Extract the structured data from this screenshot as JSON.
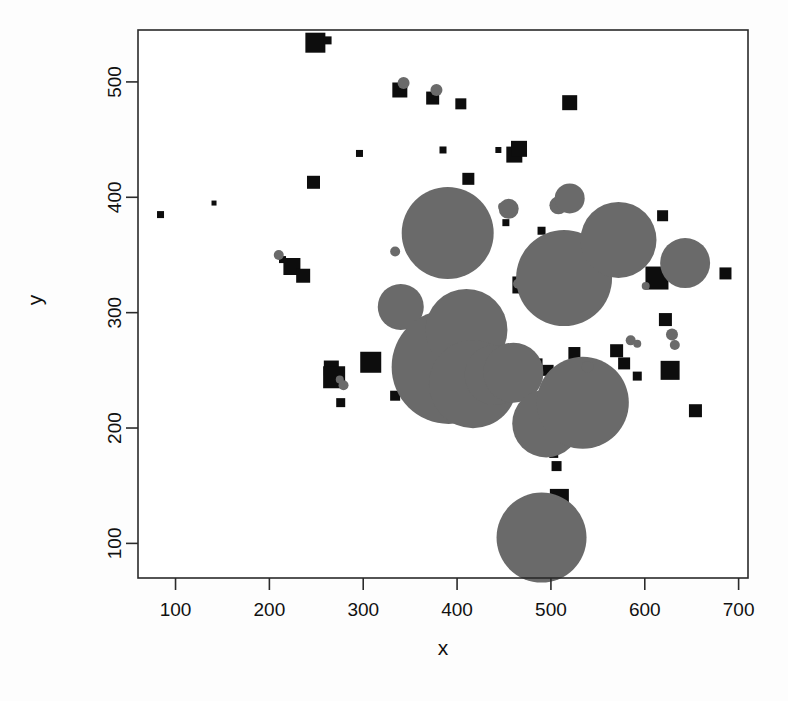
{
  "figure": {
    "background_color": "#fdfdfd",
    "plot_background_color": "#ffffff",
    "frame_color": "#2a2a2a"
  },
  "chart_data": {
    "type": "scatter",
    "title": "",
    "subtitle": "",
    "xlabel": "x",
    "ylabel": "y",
    "xlim": [
      60,
      710
    ],
    "ylim": [
      70,
      545
    ],
    "xticks": [
      100,
      200,
      300,
      400,
      500,
      600,
      700
    ],
    "yticks": [
      100,
      200,
      300,
      400,
      500
    ],
    "xtick_labels": [
      "100",
      "200",
      "300",
      "400",
      "500",
      "600",
      "700"
    ],
    "ytick_labels": [
      "100",
      "200",
      "300",
      "400",
      "500"
    ],
    "grid": false,
    "legend": false,
    "legend_position": "none",
    "series": [
      {
        "name": "black-squares",
        "marker": "square",
        "color": "#0d0d0d",
        "points": [
          {
            "x": 84,
            "y": 385,
            "size": 7
          },
          {
            "x": 141,
            "y": 395,
            "size": 5
          },
          {
            "x": 214,
            "y": 346,
            "size": 7
          },
          {
            "x": 224,
            "y": 340,
            "size": 17
          },
          {
            "x": 236,
            "y": 332,
            "size": 14
          },
          {
            "x": 247,
            "y": 413,
            "size": 13
          },
          {
            "x": 249,
            "y": 534,
            "size": 20
          },
          {
            "x": 262,
            "y": 536,
            "size": 8
          },
          {
            "x": 266,
            "y": 252,
            "size": 15
          },
          {
            "x": 269,
            "y": 244,
            "size": 22
          },
          {
            "x": 276,
            "y": 222,
            "size": 9
          },
          {
            "x": 296,
            "y": 438,
            "size": 7
          },
          {
            "x": 308,
            "y": 257,
            "size": 21
          },
          {
            "x": 334,
            "y": 228,
            "size": 10
          },
          {
            "x": 339,
            "y": 493,
            "size": 15
          },
          {
            "x": 374,
            "y": 486,
            "size": 13
          },
          {
            "x": 379,
            "y": 366,
            "size": 14
          },
          {
            "x": 385,
            "y": 441,
            "size": 7
          },
          {
            "x": 396,
            "y": 395,
            "size": 24
          },
          {
            "x": 399,
            "y": 365,
            "size": 11
          },
          {
            "x": 404,
            "y": 481,
            "size": 11
          },
          {
            "x": 412,
            "y": 416,
            "size": 12
          },
          {
            "x": 444,
            "y": 441,
            "size": 6
          },
          {
            "x": 452,
            "y": 378,
            "size": 7
          },
          {
            "x": 455,
            "y": 254,
            "size": 12
          },
          {
            "x": 460,
            "y": 254,
            "size": 14
          },
          {
            "x": 461,
            "y": 437,
            "size": 16
          },
          {
            "x": 463,
            "y": 252,
            "size": 9
          },
          {
            "x": 466,
            "y": 442,
            "size": 16
          },
          {
            "x": 468,
            "y": 324,
            "size": 17
          },
          {
            "x": 477,
            "y": 228,
            "size": 10
          },
          {
            "x": 482,
            "y": 253,
            "size": 17
          },
          {
            "x": 490,
            "y": 371,
            "size": 8
          },
          {
            "x": 497,
            "y": 250,
            "size": 11
          },
          {
            "x": 503,
            "y": 178,
            "size": 9
          },
          {
            "x": 506,
            "y": 167,
            "size": 10
          },
          {
            "x": 509,
            "y": 139,
            "size": 19
          },
          {
            "x": 512,
            "y": 124,
            "size": 10
          },
          {
            "x": 520,
            "y": 482,
            "size": 15
          },
          {
            "x": 525,
            "y": 265,
            "size": 12
          },
          {
            "x": 533,
            "y": 253,
            "size": 10
          },
          {
            "x": 557,
            "y": 357,
            "size": 9
          },
          {
            "x": 564,
            "y": 345,
            "size": 11
          },
          {
            "x": 570,
            "y": 267,
            "size": 13
          },
          {
            "x": 575,
            "y": 386,
            "size": 15
          },
          {
            "x": 578,
            "y": 256,
            "size": 12
          },
          {
            "x": 584,
            "y": 368,
            "size": 8
          },
          {
            "x": 592,
            "y": 245,
            "size": 9
          },
          {
            "x": 613,
            "y": 330,
            "size": 23
          },
          {
            "x": 619,
            "y": 384,
            "size": 11
          },
          {
            "x": 622,
            "y": 294,
            "size": 13
          },
          {
            "x": 627,
            "y": 250,
            "size": 19
          },
          {
            "x": 654,
            "y": 215,
            "size": 13
          },
          {
            "x": 686,
            "y": 334,
            "size": 12
          }
        ]
      },
      {
        "name": "gray-circles",
        "marker": "circle",
        "color": "#6a6a6a",
        "points": [
          {
            "x": 210,
            "y": 350,
            "r": 5
          },
          {
            "x": 275,
            "y": 242,
            "r": 4
          },
          {
            "x": 279,
            "y": 237,
            "r": 5
          },
          {
            "x": 334,
            "y": 353,
            "r": 5
          },
          {
            "x": 340,
            "y": 305,
            "r": 23
          },
          {
            "x": 343,
            "y": 499,
            "r": 6
          },
          {
            "x": 378,
            "y": 493,
            "r": 6
          },
          {
            "x": 390,
            "y": 369,
            "r": 46
          },
          {
            "x": 391,
            "y": 253,
            "r": 57
          },
          {
            "x": 410,
            "y": 285,
            "r": 41
          },
          {
            "x": 417,
            "y": 238,
            "r": 44
          },
          {
            "x": 440,
            "y": 246,
            "r": 30
          },
          {
            "x": 448,
            "y": 392,
            "r": 4
          },
          {
            "x": 455,
            "y": 390,
            "r": 10
          },
          {
            "x": 460,
            "y": 248,
            "r": 30
          },
          {
            "x": 465,
            "y": 325,
            "r": 5
          },
          {
            "x": 470,
            "y": 322,
            "r": 4
          },
          {
            "x": 487,
            "y": 325,
            "r": 4
          },
          {
            "x": 490,
            "y": 105,
            "r": 45
          },
          {
            "x": 495,
            "y": 204,
            "r": 34
          },
          {
            "x": 508,
            "y": 393,
            "r": 9
          },
          {
            "x": 514,
            "y": 330,
            "r": 48
          },
          {
            "x": 520,
            "y": 399,
            "r": 15
          },
          {
            "x": 534,
            "y": 222,
            "r": 46
          },
          {
            "x": 539,
            "y": 253,
            "r": 6
          },
          {
            "x": 562,
            "y": 352,
            "r": 11
          },
          {
            "x": 572,
            "y": 363,
            "r": 38
          },
          {
            "x": 585,
            "y": 276,
            "r": 5
          },
          {
            "x": 592,
            "y": 273,
            "r": 4
          },
          {
            "x": 601,
            "y": 323,
            "r": 4
          },
          {
            "x": 629,
            "y": 281,
            "r": 6
          },
          {
            "x": 632,
            "y": 272,
            "r": 5
          },
          {
            "x": 643,
            "y": 343,
            "r": 25
          }
        ]
      }
    ]
  }
}
